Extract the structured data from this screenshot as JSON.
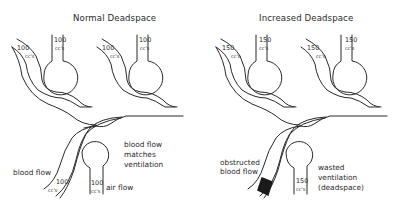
{
  "panels": [
    {
      "id": "normal",
      "title": "Normal Deadspace",
      "top_left_vessel": {
        "value": "100",
        "unit": "cc's"
      },
      "top_left_alveolus": {
        "value": "100",
        "unit": "cc's"
      },
      "top_right_vessel": {
        "value": "100",
        "unit": "cc's"
      },
      "top_right_alveolus": {
        "value": "100",
        "unit": "cc's"
      },
      "bottom_vessel": {
        "value": "100",
        "unit": "cc's"
      },
      "bottom_alveolus": {
        "value": "100",
        "unit": "cc's"
      },
      "labels": {
        "blood_flow": "blood flow",
        "air_flow": "air flow",
        "match_line1": "blood flow",
        "match_line2": "matches",
        "match_line3": "ventilation"
      }
    },
    {
      "id": "increased",
      "title": "Increased Deadspace",
      "top_left_vessel": {
        "value": "150",
        "unit": "cc's"
      },
      "top_left_alveolus": {
        "value": "150",
        "unit": "cc's"
      },
      "top_right_vessel": {
        "value": "150",
        "unit": "cc's"
      },
      "top_right_alveolus": {
        "value": "150",
        "unit": "cc's"
      },
      "bottom_alveolus": {
        "value": "150",
        "unit": "cc's"
      },
      "labels": {
        "obstructed_line1": "obstructed",
        "obstructed_line2": "blood flow",
        "wasted_line1": "wasted",
        "wasted_line2": "ventilation",
        "wasted_line3": "(deadspace)"
      }
    }
  ],
  "colors": {
    "line": "#2a2a2a",
    "background": "#ffffff",
    "obstruction": "#1a1a1a"
  }
}
